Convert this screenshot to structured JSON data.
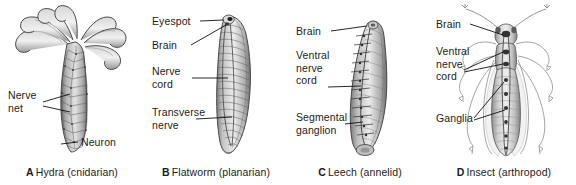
{
  "figure": {
    "background_color": "#ffffff",
    "text_color": "#1b1b1b",
    "leader_color": "#111111"
  },
  "panels": [
    {
      "key": "hydra",
      "caption_letter": "A",
      "caption_text": "Hydra (cnidarian)",
      "organism": "hydra",
      "labels": [
        {
          "id": "nerve-net",
          "lines": [
            "Nerve",
            "net"
          ]
        },
        {
          "id": "neuron",
          "lines": [
            "Neuron"
          ]
        }
      ]
    },
    {
      "key": "flatworm",
      "caption_letter": "B",
      "caption_text": "Flatworm (planarian)",
      "organism": "planarian",
      "labels": [
        {
          "id": "eyespot",
          "lines": [
            "Eyespot"
          ]
        },
        {
          "id": "brain",
          "lines": [
            "Brain"
          ]
        },
        {
          "id": "nerve-cord",
          "lines": [
            "Nerve",
            "cord"
          ]
        },
        {
          "id": "transverse-nerve",
          "lines": [
            "Transverse",
            "nerve"
          ]
        }
      ]
    },
    {
      "key": "leech",
      "caption_letter": "C",
      "caption_text": "Leech (annelid)",
      "organism": "leech",
      "labels": [
        {
          "id": "brain",
          "lines": [
            "Brain"
          ]
        },
        {
          "id": "ventral-nerve-cord",
          "lines": [
            "Ventral",
            "nerve",
            "cord"
          ]
        },
        {
          "id": "segmental-ganglion",
          "lines": [
            "Segmental",
            "ganglion"
          ]
        }
      ]
    },
    {
      "key": "insect",
      "caption_letter": "D",
      "caption_text": "Insect (arthropod)",
      "organism": "grasshopper",
      "labels": [
        {
          "id": "brain",
          "lines": [
            "Brain"
          ]
        },
        {
          "id": "ventral-nerve-cord",
          "lines": [
            "Ventral",
            "nerve",
            "cord"
          ]
        },
        {
          "id": "ganglia",
          "lines": [
            "Ganglia"
          ]
        }
      ]
    }
  ]
}
